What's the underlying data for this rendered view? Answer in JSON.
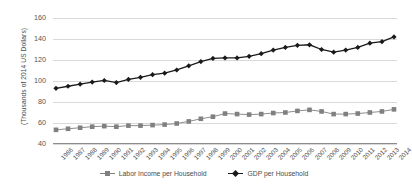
{
  "chart_data": {
    "type": "line",
    "title": "",
    "xlabel": "",
    "ylabel": "(Thousands of 2014 US Dollars)",
    "ylim": [
      40,
      160
    ],
    "yticks": [
      40,
      60,
      80,
      100,
      120,
      140,
      160
    ],
    "grid": true,
    "legend_position": "bottom-center",
    "categories": [
      "1986",
      "1987",
      "1988",
      "1989",
      "1990",
      "1991",
      "1992",
      "1993",
      "1994",
      "1995",
      "1996",
      "1997",
      "1998",
      "1999",
      "2000",
      "2001",
      "2002",
      "2003",
      "2004",
      "2005",
      "2006",
      "2007",
      "2008",
      "2009",
      "2010",
      "2011",
      "2012",
      "2013",
      "2014"
    ],
    "series": [
      {
        "name": "Labor Income per Household",
        "marker": "square",
        "color": "#808080",
        "values": [
          53.5,
          54.5,
          55.5,
          56.5,
          57.0,
          56.5,
          57.5,
          57.5,
          58.0,
          58.5,
          59.5,
          61.5,
          64.0,
          66.0,
          69.0,
          68.5,
          68.0,
          68.5,
          69.5,
          70.0,
          71.5,
          72.5,
          71.0,
          68.5,
          68.5,
          69.0,
          70.0,
          71.0,
          73.0
        ]
      },
      {
        "name": "GDP per Household",
        "marker": "diamond",
        "color": "#1a1a1a",
        "values": [
          93.0,
          95.0,
          97.0,
          99.0,
          100.5,
          98.5,
          101.5,
          103.5,
          106.0,
          107.5,
          110.5,
          114.5,
          118.5,
          121.5,
          122.0,
          122.0,
          123.5,
          126.0,
          129.5,
          132.0,
          134.0,
          134.5,
          130.0,
          127.5,
          129.5,
          132.0,
          136.0,
          137.5,
          142.0
        ]
      }
    ]
  },
  "legend": {
    "items": [
      {
        "label": "Labor Income per Household",
        "marker": "square-marker",
        "color": "#808080"
      },
      {
        "label": "GDP per Household",
        "marker": "diamond-marker",
        "color": "#1a1a1a"
      }
    ]
  }
}
